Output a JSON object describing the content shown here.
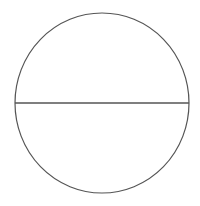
{
  "diagram": {
    "type": "circle-with-diameter",
    "background": "#ffffff",
    "circle": {
      "cx": 102,
      "cy": 103,
      "rx": 87,
      "ry": 90,
      "stroke": "#555555",
      "stroke_width": 1.2,
      "fill": "none"
    },
    "diameter": {
      "x1": 15,
      "y1": 103,
      "x2": 189,
      "y2": 103,
      "stroke": "#555555",
      "stroke_width": 1.4
    }
  }
}
